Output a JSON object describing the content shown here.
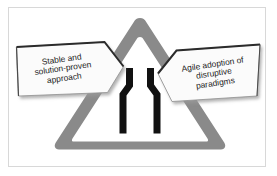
{
  "figure": {
    "background_color": "#ffffff",
    "frame_color": "#d8d8d8"
  },
  "sign": {
    "name": "road-narrows-warning-sign",
    "shape": "rounded-triangle",
    "band_color": "#8a8a8a",
    "inner_color": "#ffffff",
    "outline_color": "#ffffff",
    "symbol": {
      "name": "road-narrows-symbol",
      "color": "#111111",
      "description": "two converging vertical bars"
    }
  },
  "arrows": {
    "left": {
      "name": "left-arrow-callout",
      "direction": "right",
      "fill_color": "#fbfbfb",
      "edge_color": "#2b2b2b",
      "lines": [
        "Stable and",
        "solution-proven",
        "approach"
      ],
      "text_line_1": "Stable and",
      "text_line_2": "solution-proven",
      "text_line_3": "approach"
    },
    "right": {
      "name": "right-arrow-callout",
      "direction": "left",
      "fill_color": "#fbfbfb",
      "edge_color": "#2b2b2b",
      "lines": [
        "Agile adoption of",
        "disruptive",
        "paradigms"
      ],
      "text_line_1": "Agile adoption of",
      "text_line_2": "disruptive",
      "text_line_3": "paradigms"
    }
  }
}
